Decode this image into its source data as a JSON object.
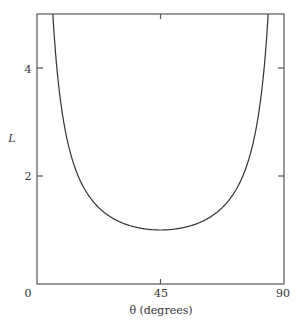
{
  "chart_data": {
    "type": "line",
    "title": "",
    "xlabel": "θ (degrees)",
    "ylabel": "L",
    "xlim": [
      0,
      90
    ],
    "ylim": [
      0,
      5
    ],
    "xticks": [
      0,
      45,
      90
    ],
    "xtick_labels": [
      "0",
      "45",
      "90"
    ],
    "yticks": [
      2,
      4
    ],
    "ytick_labels": [
      "2",
      "4"
    ],
    "grid": false,
    "legend": null,
    "function": "L = 1 / sin(2θ)",
    "series": [
      {
        "name": "L",
        "x": [
          5.77,
          7,
          8,
          10,
          12,
          15,
          20,
          25,
          30,
          35,
          40,
          45,
          50,
          55,
          60,
          65,
          70,
          75,
          78,
          80,
          82,
          83,
          84.23
        ],
        "y": [
          5.0,
          4.13,
          3.62,
          2.92,
          2.46,
          2.0,
          1.56,
          1.31,
          1.15,
          1.06,
          1.02,
          1.0,
          1.02,
          1.06,
          1.15,
          1.31,
          1.56,
          2.0,
          2.46,
          2.92,
          3.62,
          4.13,
          5.0
        ]
      }
    ],
    "min_point": {
      "x": 45,
      "y": 1.0
    },
    "colors": {
      "line": "#333333",
      "axes": "#555555",
      "text": "#333333"
    }
  }
}
